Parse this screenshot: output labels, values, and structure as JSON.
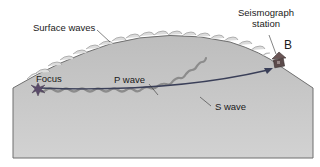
{
  "diagram": {
    "labels": {
      "surface_waves": "Surface waves",
      "seismograph_line1": "Seismograph",
      "seismograph_line2": "station",
      "station_id": "B",
      "focus": "Focus",
      "p_wave": "P wave",
      "s_wave": "S wave"
    },
    "colors": {
      "ground_fill": "#c4c4c4",
      "ground_edge": "#6f6f6f",
      "surface_bumps": "#dadada",
      "p_wave_line": "#3a3f58",
      "s_wave_line": "#8c8c8c",
      "focus_star": "#5a4a6a",
      "station": "#5b4a4a",
      "leader": "#333333"
    }
  }
}
